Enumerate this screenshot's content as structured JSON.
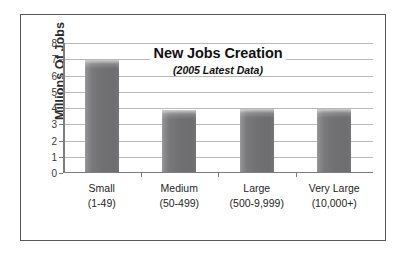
{
  "chart_data": {
    "type": "bar",
    "title": "New Jobs Creation",
    "subtitle": "(2005 Latest Data)",
    "xlabel": "",
    "ylabel": "Millions Of Jobs",
    "categories": [
      "Small",
      "Medium",
      "Large",
      "Very Large"
    ],
    "category_sublabels": [
      "(1-49)",
      "(50-499)",
      "(500-9,999)",
      "(10,000+)"
    ],
    "values": [
      6.9,
      3.8,
      3.85,
      3.85
    ],
    "ylim": [
      0,
      8
    ],
    "ytick_labels": [
      "0",
      "1",
      "2",
      "3",
      "4",
      "5",
      "6",
      "7",
      "8"
    ],
    "ytick_values": [
      0,
      1,
      2,
      3,
      4,
      5,
      6,
      7,
      8
    ],
    "grid": true,
    "grid_axis": "y",
    "legend": false,
    "bar_color": "#727274",
    "gridline_color": "#b9b9bb",
    "axis_color": "#7d7d80",
    "frame_color": "#58585a",
    "background_color": "#ffffff",
    "text_color": "#262626"
  }
}
